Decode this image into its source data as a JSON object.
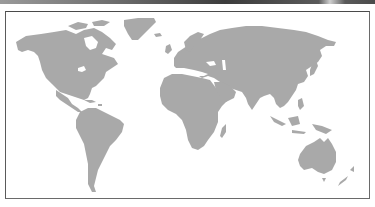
{
  "toolbar": {
    "description": "cropped dark toolbar strip at top edge"
  },
  "map": {
    "type": "world-map",
    "projection": "equirectangular",
    "style": "grayscale silhouette",
    "colors": {
      "land": "#a9a9a9",
      "water": "#ffffff",
      "border": "#6a6a6a",
      "toolbar": "#3c3c3c"
    },
    "regions": [
      {
        "id": "north-america",
        "name": "North America"
      },
      {
        "id": "greenland",
        "name": "Greenland"
      },
      {
        "id": "south-america",
        "name": "South America"
      },
      {
        "id": "europe",
        "name": "Europe"
      },
      {
        "id": "africa",
        "name": "Africa"
      },
      {
        "id": "asia",
        "name": "Asia"
      },
      {
        "id": "australia",
        "name": "Australia"
      },
      {
        "id": "madagascar",
        "name": "Madagascar"
      },
      {
        "id": "indonesia",
        "name": "Indonesia"
      },
      {
        "id": "japan",
        "name": "Japan"
      },
      {
        "id": "new-zealand",
        "name": "New Zealand"
      },
      {
        "id": "uk",
        "name": "United Kingdom"
      },
      {
        "id": "iceland",
        "name": "Iceland"
      },
      {
        "id": "new-guinea",
        "name": "New Guinea"
      },
      {
        "id": "philippines",
        "name": "Philippines"
      },
      {
        "id": "caribbean",
        "name": "Caribbean"
      }
    ]
  }
}
